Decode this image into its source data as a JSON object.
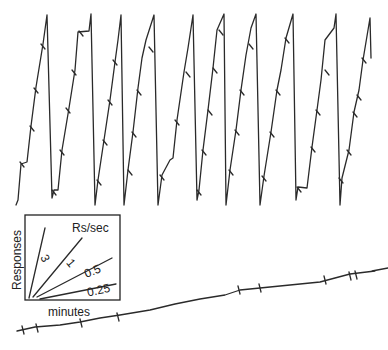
{
  "diagram": {
    "type": "cumulative-record",
    "upper_record": {
      "description": "High-rate sawtooth cumulative record with pen resets",
      "peaks_x": [
        47,
        91,
        121,
        154,
        193,
        224,
        256,
        293,
        336,
        370
      ],
      "color": "#2a2a2a"
    },
    "lower_record": {
      "description": "Low-rate cumulative record",
      "color": "#2a2a2a"
    },
    "legend": {
      "title": "Rs/sec",
      "y_label": "Responses",
      "x_label": "minutes",
      "rates": [
        "3",
        "1",
        "0.5",
        "0.25"
      ]
    }
  }
}
